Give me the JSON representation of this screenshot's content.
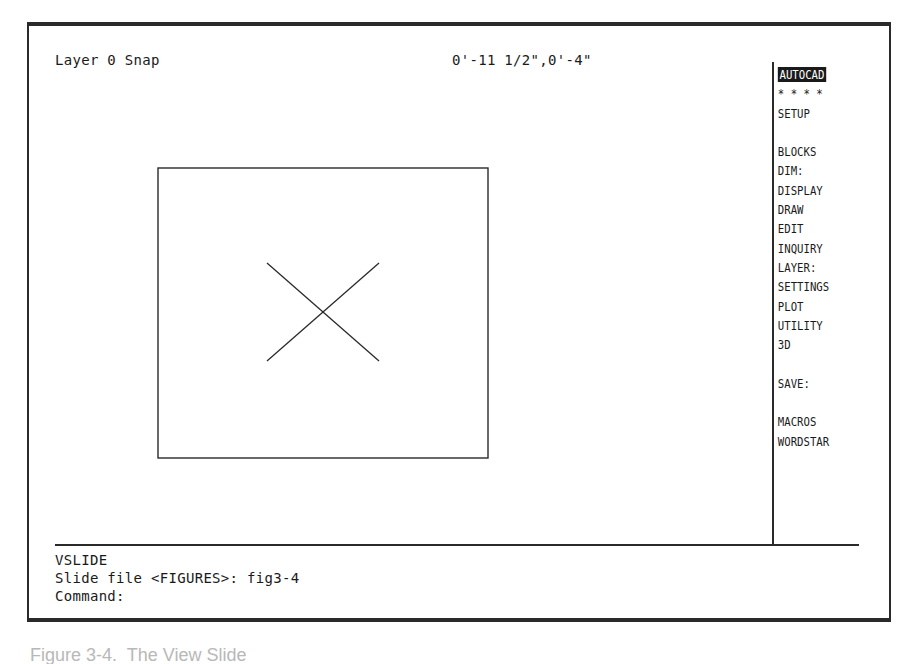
{
  "app": {
    "name": "AutoCAD"
  },
  "status_line": {
    "layer_text": "Layer 0 Snap",
    "coordinates": "0'-11 1/2\",0'-4\""
  },
  "screen_menu": {
    "items": [
      {
        "label": "AUTOCAD",
        "highlighted": true
      },
      {
        "label": "* * * *",
        "highlighted": false
      },
      {
        "label": "SETUP",
        "highlighted": false
      },
      {
        "label": "",
        "gap": true
      },
      {
        "label": "BLOCKS",
        "highlighted": false
      },
      {
        "label": "DIM:",
        "highlighted": false
      },
      {
        "label": "DISPLAY",
        "highlighted": false
      },
      {
        "label": "DRAW",
        "highlighted": false
      },
      {
        "label": "EDIT",
        "highlighted": false
      },
      {
        "label": "INQUIRY",
        "highlighted": false
      },
      {
        "label": "LAYER:",
        "highlighted": false
      },
      {
        "label": "SETTINGS",
        "highlighted": false
      },
      {
        "label": "PLOT",
        "highlighted": false
      },
      {
        "label": "UTILITY",
        "highlighted": false
      },
      {
        "label": "3D",
        "highlighted": false
      },
      {
        "label": "",
        "gap": true
      },
      {
        "label": "SAVE:",
        "highlighted": false
      },
      {
        "label": "",
        "gap": true
      },
      {
        "label": "MACROS",
        "highlighted": false
      },
      {
        "label": "WORDSTAR",
        "highlighted": false
      }
    ]
  },
  "drawing": {
    "slide_contents": "rectangle with X cross",
    "rectangle": {
      "x": 0,
      "y": 0,
      "width": 330,
      "height": 290
    },
    "line_color": "#2a2a2a",
    "cross": [
      {
        "x1": 110,
        "y1": 96,
        "x2": 222,
        "y2": 194
      },
      {
        "x1": 110,
        "y1": 194,
        "x2": 222,
        "y2": 96
      }
    ]
  },
  "command_area": {
    "lines": [
      "VSLIDE",
      "Slide file <FIGURES>: fig3-4",
      "Command:"
    ]
  },
  "caption": {
    "text": "Figure 3-4.  The View Slide"
  },
  "colors": {
    "foreground": "#1a1a1a",
    "background": "#ffffff",
    "frame": "#2a2a2a"
  }
}
